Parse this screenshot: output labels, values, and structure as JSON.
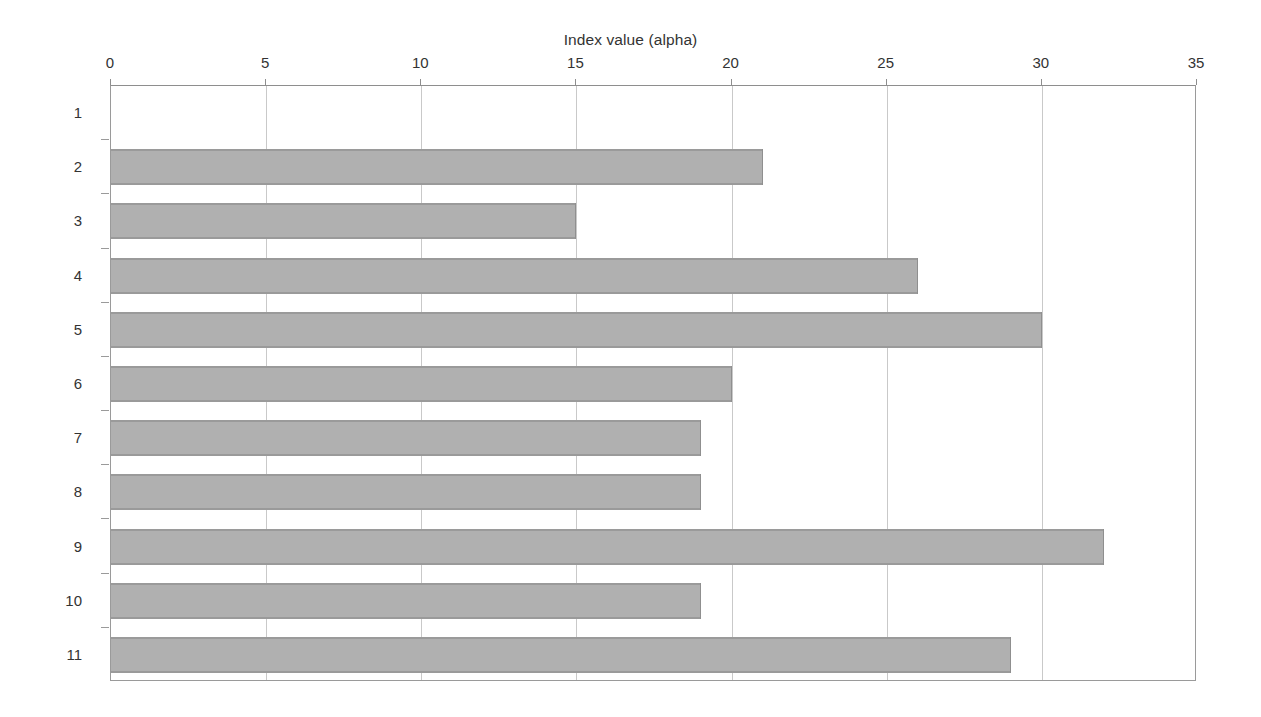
{
  "chart_data": {
    "type": "bar",
    "orientation": "horizontal",
    "title": "",
    "xlabel": "Index value (alpha)",
    "ylabel": "Sample number",
    "categories": [
      "1",
      "2",
      "3",
      "4",
      "5",
      "6",
      "7",
      "8",
      "9",
      "10",
      "11"
    ],
    "values": [
      0,
      21,
      15,
      26,
      30,
      20,
      19,
      19,
      32,
      19,
      29
    ],
    "series": [
      {
        "name": "Index value (alpha)",
        "values": [
          0,
          21,
          15,
          26,
          30,
          20,
          19,
          19,
          32,
          19,
          29
        ]
      }
    ],
    "xlim": [
      0,
      35
    ],
    "xticks": [
      0,
      5,
      10,
      15,
      20,
      25,
      30,
      35
    ],
    "xtick_labels": [
      "0",
      "5",
      "10",
      "15",
      "20",
      "25",
      "30",
      "35"
    ],
    "x_axis_position": "top",
    "y_axis_inverted": true,
    "grid": {
      "vertical": true,
      "horizontal": false
    },
    "legend": {
      "visible": false
    },
    "colors": {
      "bar_fill": "#b0b0b0",
      "bar_edge": "#8f8f8f",
      "gridline": "#c9c9c9",
      "axis": "#9a9a9a",
      "text": "#333333",
      "background": "#ffffff"
    }
  }
}
